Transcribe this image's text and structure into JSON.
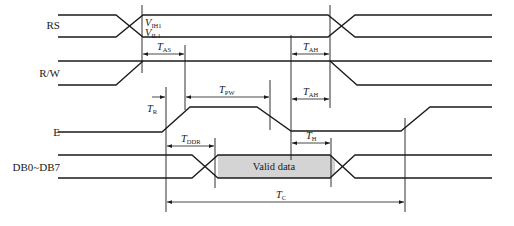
{
  "diagram": {
    "type": "timing-diagram",
    "signals": [
      {
        "id": "rs",
        "label": "RS"
      },
      {
        "id": "rw",
        "label": "R/W"
      },
      {
        "id": "e",
        "label": "E"
      },
      {
        "id": "db",
        "label": "DB0~DB7"
      }
    ],
    "levels": {
      "vih": {
        "main": "V",
        "sub": "IH1"
      },
      "vil": {
        "main": "V",
        "sub": "IL1"
      }
    },
    "timings": {
      "tas": {
        "main": "T",
        "sub": "AS"
      },
      "tah1": {
        "main": "T",
        "sub": "AH"
      },
      "tah2": {
        "main": "T",
        "sub": "AH"
      },
      "tr": {
        "main": "T",
        "sub": "R"
      },
      "tpw": {
        "main": "T",
        "sub": "PW"
      },
      "th": {
        "main": "T",
        "sub": "H"
      },
      "tddr": {
        "main": "T",
        "sub": "DDR"
      },
      "tc": {
        "main": "T",
        "sub": "C"
      }
    },
    "valid_data_label": "Valid data",
    "colors": {
      "line": "#1a1a1a",
      "valid_fill": "#d4d4d4"
    }
  }
}
